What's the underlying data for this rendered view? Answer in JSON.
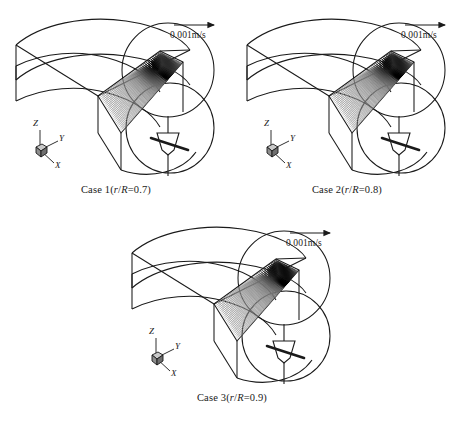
{
  "figure": {
    "type": "cfd-velocity-vector-panels",
    "background_color": "#ffffff",
    "line_color": "#1a1a1a",
    "panel_count": 3
  },
  "scale_bar": {
    "label": "0.001m/s",
    "arrow_icon": "right-arrow-icon",
    "length_px": 46
  },
  "axis_triad": {
    "z_label": "Z",
    "y_label": "Y",
    "x_label": "X",
    "origin_marker": "cube-icon"
  },
  "geometry": {
    "impeller_icon": "impeller-icon",
    "duct_shape": "annular-sector-duct",
    "vector_plane": "radial-cross-section-plane"
  },
  "panels": [
    {
      "id": "case-1",
      "caption_prefix": "Case 1(",
      "caption_r": "r",
      "caption_slash": "/",
      "caption_R": "R",
      "caption_suffix": "=0.7)",
      "caption_plain": "Case 1(r/R=0.7)",
      "case_number": "1",
      "r_over_R": "0.7"
    },
    {
      "id": "case-2",
      "caption_prefix": "Case 2(",
      "caption_r": "r",
      "caption_slash": "/",
      "caption_R": "R",
      "caption_suffix": "=0.8)",
      "caption_plain": "Case 2(r/R=0.8)",
      "case_number": "2",
      "r_over_R": "0.8"
    },
    {
      "id": "case-3",
      "caption_prefix": "Case 3(",
      "caption_r": "r",
      "caption_slash": "/",
      "caption_R": "R",
      "caption_suffix": "=0.9)",
      "caption_plain": "Case 3(r/R=0.9)",
      "case_number": "3",
      "r_over_R": "0.9"
    }
  ],
  "chart_data": {
    "type": "scatter",
    "title": "",
    "xlabel": "",
    "ylabel": "",
    "legend_position": "top-right",
    "grid": false,
    "series": [
      {
        "name": "Case 1 (r/R=0.7)",
        "reference_vector_m_per_s": 0.001,
        "max_relative_magnitude": 1.0,
        "magnitude_field_note": "longest/darkest arrows clustered near the upper-right corner of the plane, short light arrows toward the lower-left"
      },
      {
        "name": "Case 2 (r/R=0.8)",
        "reference_vector_m_per_s": 0.001,
        "max_relative_magnitude": 1.0,
        "magnitude_field_note": "dark arrow cluster shifted slightly right and downward relative to Case 1"
      },
      {
        "name": "Case 3 (r/R=0.9)",
        "reference_vector_m_per_s": 0.001,
        "max_relative_magnitude": 1.0,
        "magnitude_field_note": "dark arrow band extends along the right edge of the plane"
      }
    ]
  }
}
